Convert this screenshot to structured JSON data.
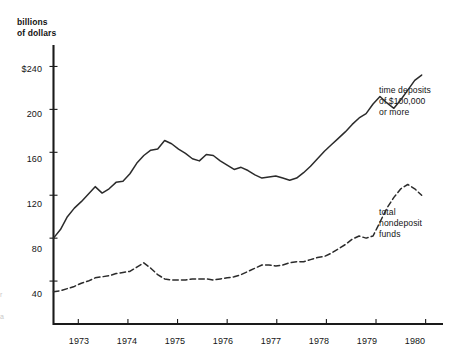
{
  "chart_data": {
    "type": "line",
    "title": "",
    "subtitle": "",
    "ylabel": "billions\nof dollars",
    "xlabel": "",
    "ylim": [
      0,
      260
    ],
    "xlim": [
      1972.5,
      1980.35
    ],
    "grid": false,
    "legend_position": "inline-right",
    "yticks": [
      240,
      200,
      160,
      120,
      80,
      40
    ],
    "ytick_labels": [
      "$240",
      "200",
      "160",
      "120",
      "80",
      "40"
    ],
    "xticks": [
      1973,
      1974,
      1975,
      1976,
      1977,
      1978,
      1979,
      1980
    ],
    "xtick_labels": [
      "1973",
      "1974",
      "1975",
      "1976",
      "1977",
      "1978",
      "1979",
      "1980"
    ],
    "series": [
      {
        "name": "time deposits of $100,000 or more",
        "style": "solid",
        "color": "#2b2b2b",
        "label_text": "time deposits\nof $100,000\nor more",
        "x": [
          1972.5,
          1972.64,
          1972.78,
          1972.92,
          1973.06,
          1973.2,
          1973.34,
          1973.48,
          1973.62,
          1973.76,
          1973.9,
          1974.04,
          1974.18,
          1974.32,
          1974.46,
          1974.6,
          1974.74,
          1974.88,
          1975.02,
          1975.16,
          1975.3,
          1975.44,
          1975.58,
          1975.72,
          1975.86,
          1976.0,
          1976.14,
          1976.28,
          1976.42,
          1976.56,
          1976.7,
          1976.84,
          1976.98,
          1977.12,
          1977.26,
          1977.4,
          1977.54,
          1977.68,
          1977.82,
          1977.96,
          1978.1,
          1978.24,
          1978.38,
          1978.52,
          1978.66,
          1978.8,
          1978.94,
          1979.08,
          1979.22,
          1979.36,
          1979.5,
          1979.64,
          1979.78,
          1979.92
        ],
        "y": [
          80,
          88,
          100,
          108,
          114,
          121,
          128,
          122,
          126,
          132,
          133,
          140,
          150,
          157,
          162,
          163,
          171,
          168,
          163,
          159,
          154,
          152,
          158,
          157,
          152,
          148,
          144,
          146,
          143,
          139,
          136,
          137,
          138,
          136,
          134,
          136,
          141,
          147,
          154,
          161,
          167,
          173,
          179,
          186,
          192,
          196,
          205,
          212,
          206,
          201,
          209,
          218,
          227,
          232
        ]
      },
      {
        "name": "total nondeposit funds",
        "style": "dashed",
        "color": "#2b2b2b",
        "label_text": "total\nnondeposit\nfunds",
        "x": [
          1972.5,
          1972.64,
          1972.78,
          1972.92,
          1973.06,
          1973.2,
          1973.34,
          1973.48,
          1973.62,
          1973.76,
          1973.9,
          1974.04,
          1974.18,
          1974.32,
          1974.46,
          1974.6,
          1974.74,
          1974.88,
          1975.02,
          1975.16,
          1975.3,
          1975.44,
          1975.58,
          1975.72,
          1975.86,
          1976.0,
          1976.14,
          1976.28,
          1976.42,
          1976.56,
          1976.7,
          1976.84,
          1976.98,
          1977.12,
          1977.26,
          1977.4,
          1977.54,
          1977.68,
          1977.82,
          1977.96,
          1978.1,
          1978.24,
          1978.38,
          1978.52,
          1978.66,
          1978.8,
          1978.94,
          1979.08,
          1979.22,
          1979.36,
          1979.5,
          1979.64,
          1979.78,
          1979.92
        ],
        "y": [
          30,
          31,
          33,
          35,
          38,
          40,
          43,
          44,
          45,
          47,
          48,
          49,
          53,
          57,
          52,
          46,
          42,
          41,
          41,
          41,
          42,
          42,
          42,
          41,
          42,
          43,
          44,
          46,
          49,
          52,
          55,
          55,
          54,
          55,
          57,
          58,
          58,
          60,
          62,
          63,
          66,
          70,
          74,
          79,
          82,
          80,
          82,
          95,
          108,
          118,
          126,
          130,
          126,
          120
        ]
      }
    ]
  },
  "labels": {
    "series1": "time deposits\nof $100,000\nor more",
    "series2": "total\nnondeposit\nfunds",
    "axis_title": "billions\nof dollars"
  },
  "ytick_labels": {
    "t0": "$240",
    "t1": "200",
    "t2": "160",
    "t3": "120",
    "t4": "80",
    "t5": "40"
  },
  "xtick_labels": {
    "x0": "1973",
    "x1": "1974",
    "x2": "1975",
    "x3": "1976",
    "x4": "1977",
    "x5": "1978",
    "x6": "1979",
    "x7": "1980"
  }
}
